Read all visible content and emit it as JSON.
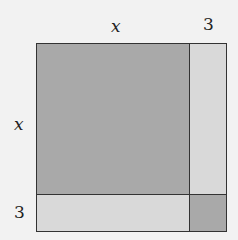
{
  "labels": {
    "top_x": "x",
    "top_3": "3",
    "left_x": "x",
    "left_3": "3"
  },
  "colors": {
    "background": "#f2f2f2",
    "dark_fill": "#a9a9a9",
    "light_fill": "#d9d9d9",
    "border": "#333333"
  },
  "regions": [
    {
      "name": "x-by-x square",
      "shade": "dark"
    },
    {
      "name": "3-by-x right strip",
      "shade": "light"
    },
    {
      "name": "x-by-3 bottom strip",
      "shade": "light"
    },
    {
      "name": "3-by-3 corner square",
      "shade": "dark"
    }
  ]
}
